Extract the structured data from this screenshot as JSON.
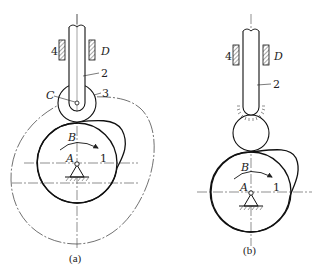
{
  "figure": {
    "colors": {
      "stroke": "#222222",
      "background": "#ffffff",
      "hatch": "#555555"
    }
  },
  "panel_a": {
    "caption": "(a)",
    "labels": {
      "guide_left": "4",
      "guide_right": "D",
      "follower": "2",
      "roller": "3",
      "roller_center": "C",
      "contact_point": "B",
      "cam_center": "A",
      "cam": "1"
    }
  },
  "panel_b": {
    "caption": "(b)",
    "labels": {
      "guide_left": "4",
      "guide_right": "D",
      "follower": "2",
      "contact_point": "B",
      "cam_center": "A",
      "cam": "1"
    }
  }
}
